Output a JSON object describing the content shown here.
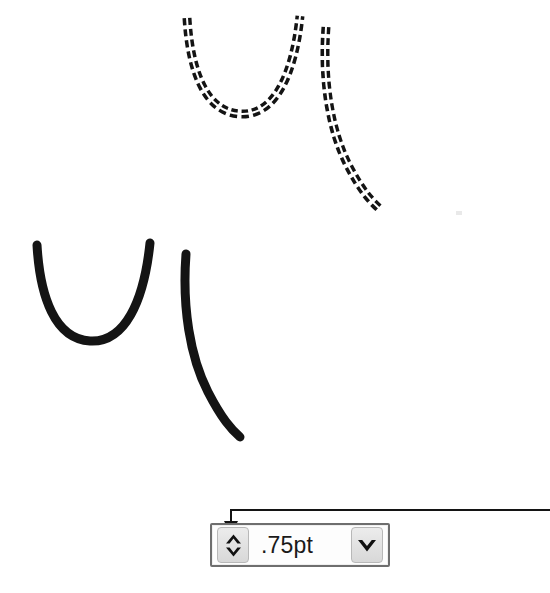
{
  "figure": {
    "background_color": "#ffffff",
    "stroke_color": "#141414"
  },
  "curves": {
    "dashed_group": {
      "style_name": "dashed-double-line",
      "label": "dashed double stroke curves",
      "stroke_color": "#141414",
      "stroke_width": 9,
      "inner_gap_color": "#ffffff",
      "inner_gap_width": 2,
      "dash_pattern": "7 4",
      "u_curve_path": "M 187 18 C 190 70, 205 112, 240 114 C 275 116, 294 74, 300 16",
      "tail_curve_path": "M 326 27 C 322 80, 330 130, 348 165 C 362 192, 372 202, 381 210"
    },
    "solid_group": {
      "style_name": "solid-line",
      "label": "solid stroke curves",
      "stroke_color": "#141414",
      "stroke_width": 9,
      "u_curve_path": "M 37 245 C 40 297, 55 339, 90 341 C 125 343, 144 301, 150 243",
      "tail_curve_path": "M 186 254 C 182 307, 190 357, 208 392 C 222 419, 231 429, 240 437"
    }
  },
  "callout": {
    "name": "leader-line-to-spinner",
    "color": "#141414",
    "stroke_width": 2,
    "path": "M 550 510 L 231 510 L 231 524",
    "arrowhead": "down-triangle",
    "arrow_tip_x": 231,
    "arrow_tip_y": 534
  },
  "line_weight_control": {
    "name": "line-weight-combo-box",
    "value": ".75pt",
    "placeholder": ".75pt",
    "spinner": {
      "increase_label": "Increase line weight",
      "decrease_label": "Decrease line weight",
      "up_icon": "chevron-up-icon",
      "down_icon": "chevron-down-icon"
    },
    "dropdown": {
      "label": "Show line weight list",
      "icon": "chevron-down-icon"
    },
    "border_color": "#6e6e6e",
    "button_face_color": "#e4e4e4",
    "field_background": "#fdfdfd"
  }
}
